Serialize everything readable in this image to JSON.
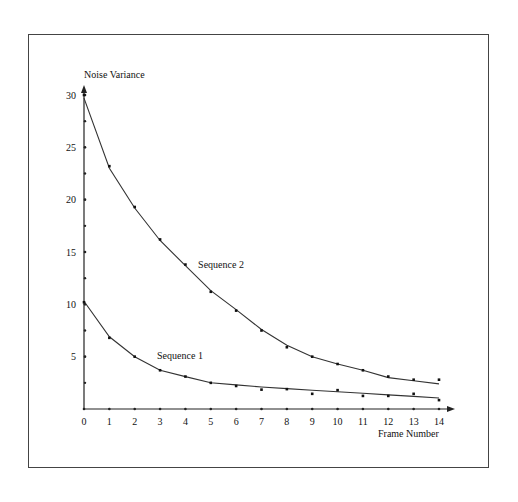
{
  "chart_data": {
    "type": "line",
    "title": "",
    "xlabel": "Frame Number",
    "ylabel": "Noise Variance",
    "xlim": [
      0,
      14
    ],
    "ylim": [
      0,
      30
    ],
    "x_ticks": [
      0,
      1,
      2,
      3,
      4,
      5,
      6,
      7,
      8,
      9,
      10,
      11,
      12,
      13,
      14
    ],
    "y_ticks": [
      5,
      10,
      15,
      20,
      25,
      30
    ],
    "y_minor_ticks": [
      2.5,
      7.5,
      12.5,
      17.5,
      22.5,
      27.5
    ],
    "grid": false,
    "legend": "inline labels",
    "x": [
      0,
      1,
      2,
      3,
      4,
      5,
      6,
      7,
      8,
      9,
      10,
      11,
      12,
      13,
      14
    ],
    "series": [
      {
        "name": "Sequence 1",
        "label_pos": [
          3,
          5.1
        ],
        "values": [
          10.2,
          6.8,
          5.0,
          3.7,
          3.1,
          2.5,
          2.2,
          1.85,
          1.9,
          1.45,
          1.8,
          1.25,
          1.25,
          1.45,
          0.85
        ],
        "fit": [
          10.3,
          6.9,
          5.0,
          3.7,
          3.1,
          2.5,
          2.3,
          2.1,
          1.95,
          1.8,
          1.65,
          1.5,
          1.35,
          1.2,
          1.05
        ]
      },
      {
        "name": "Sequence 2",
        "label_pos": [
          4.5,
          13.8
        ],
        "values": [
          30.0,
          23.2,
          19.3,
          16.2,
          13.8,
          11.2,
          9.4,
          7.5,
          5.9,
          5.0,
          4.3,
          3.7,
          3.1,
          2.8,
          2.8
        ],
        "fit": [
          29.7,
          23.0,
          19.2,
          16.1,
          13.7,
          11.3,
          9.5,
          7.6,
          6.1,
          5.0,
          4.3,
          3.7,
          3.0,
          2.7,
          2.4
        ]
      }
    ]
  }
}
